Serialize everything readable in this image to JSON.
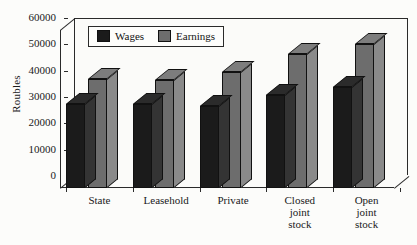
{
  "chart_data": {
    "type": "bar",
    "title": "",
    "xlabel": "",
    "ylabel": "Roubles",
    "ylim": [
      0,
      60000
    ],
    "yticks": [
      0,
      10000,
      20000,
      30000,
      40000,
      50000,
      60000
    ],
    "ytick_labels": [
      "0",
      "10000",
      "20000",
      "30000",
      "40000",
      "50000",
      "60000"
    ],
    "grid": false,
    "legend_position": "upper-left-inside",
    "style": "3d-grouped-bars",
    "categories": [
      "State",
      "Leasehold",
      "Private",
      "Closed joint stock",
      "Open joint stock"
    ],
    "category_label_lines": [
      [
        "State"
      ],
      [
        "Leasehold"
      ],
      [
        "Private"
      ],
      [
        "Closed",
        "joint",
        "stock"
      ],
      [
        "Open",
        "joint",
        "stock"
      ]
    ],
    "series": [
      {
        "name": "Wages",
        "color": "#1b1b1b",
        "values": [
          32000,
          32000,
          31000,
          35500,
          38500
        ]
      },
      {
        "name": "Earnings",
        "color": "#6d6d6d",
        "values": [
          41500,
          41000,
          44000,
          51000,
          54500
        ]
      }
    ]
  },
  "legend": {
    "items": [
      {
        "label": "Wages",
        "swatch": "legend-swatch-wages"
      },
      {
        "label": "Earnings",
        "swatch": "legend-swatch-earnings"
      }
    ]
  },
  "colors": {
    "wages": "#1b1b1b",
    "earnings": "#6d6d6d",
    "axis": "#2a2a2a",
    "background": "#fcfcfa"
  }
}
